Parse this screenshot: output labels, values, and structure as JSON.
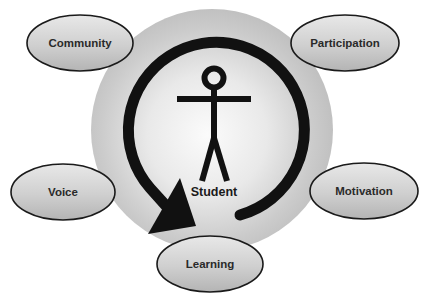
{
  "diagram": {
    "center": {
      "label": "Student",
      "icon": "stick-figure-icon"
    },
    "cycle_arrow": {
      "direction": "clockwise-to-bottom-left",
      "icon": "circular-arrow-icon"
    },
    "nodes": [
      {
        "id": "community",
        "label": "Community"
      },
      {
        "id": "participation",
        "label": "Participation"
      },
      {
        "id": "voice",
        "label": "Voice"
      },
      {
        "id": "motivation",
        "label": "Motivation"
      },
      {
        "id": "learning",
        "label": "Learning"
      }
    ],
    "colors": {
      "outer_circle": "#c4c4c4",
      "inner_highlight": "#f4f4f4",
      "ellipse_fill_top": "#e6e6e6",
      "ellipse_fill_bottom": "#b8b8b8",
      "stroke": "#1a1a1a",
      "text": "#2a2a2a"
    }
  }
}
